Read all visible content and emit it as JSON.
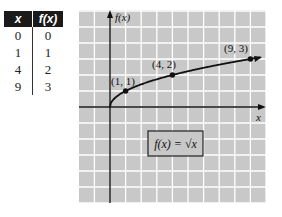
{
  "table": {
    "headers": [
      "x",
      "f(x)"
    ],
    "rows": [
      [
        "0",
        "0"
      ],
      [
        "1",
        "1"
      ],
      [
        "4",
        "2"
      ],
      [
        "9",
        "3"
      ]
    ]
  },
  "chart_data": {
    "type": "line",
    "title": "",
    "xlabel": "x",
    "ylabel": "f(x)",
    "function": "f(x) = sqrt(x)",
    "legend_box": "f(x) = √x",
    "x": [
      0,
      1,
      4,
      9
    ],
    "values": [
      0,
      1,
      2,
      3
    ],
    "series": [
      {
        "name": "f(x) = √x",
        "x": [
          0,
          1,
          4,
          9
        ],
        "values": [
          0,
          1,
          2,
          3
        ]
      }
    ],
    "marked_points": [
      {
        "x": 1,
        "y": 1,
        "label": "(1, 1)"
      },
      {
        "x": 4,
        "y": 2,
        "label": "(4, 2)"
      },
      {
        "x": 9,
        "y": 3,
        "label": "(9, 3)"
      }
    ],
    "xlim": [
      -2,
      10
    ],
    "ylim": [
      -6,
      6
    ],
    "grid": true,
    "colors": {
      "background": "#c8c8c8",
      "gridline": "#ffffff",
      "curve": "#111111"
    }
  }
}
